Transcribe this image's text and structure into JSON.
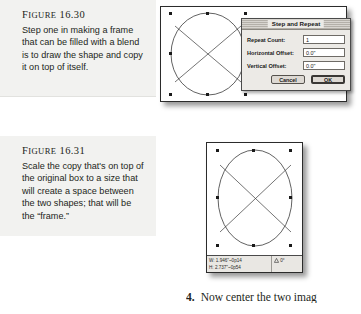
{
  "page": {
    "background_color": "#ffffff",
    "caption_background_color": "#f2f2f0",
    "ink_color": "#231f20"
  },
  "figures": [
    {
      "label_prefix": "F",
      "label_word": "IGURE",
      "label_number": "16.30",
      "caption": "Step one in making a frame that can be filled with a blend is to draw the shape and copy it on top of itself.",
      "artwork": {
        "shape": "ellipse-with-x",
        "selected": true,
        "handle_count": 8
      }
    },
    {
      "label_prefix": "F",
      "label_word": "IGURE",
      "label_number": "16.31",
      "caption": "Scale the copy that's on top of the original box to a size that will create a space between the two shapes; that will be the “frame.”",
      "artwork": {
        "shape": "ellipse-with-x",
        "selected": true,
        "handle_count": 8
      }
    }
  ],
  "dialog": {
    "title": "Step and Repeat",
    "fields": [
      {
        "label": "Repeat Count:",
        "value": "1"
      },
      {
        "label": "Horizontal Offset:",
        "value": "0.0\""
      },
      {
        "label": "Vertical Offset:",
        "value": "0.0\""
      }
    ],
    "buttons": {
      "cancel": "Cancel",
      "ok": "OK"
    }
  },
  "measure_palette": {
    "width_label": "W:",
    "width_value": "1.946\"~0p14",
    "height_label": "H:",
    "height_value": "2.737\"~0p54",
    "angle_icon": "triangle-icon",
    "angle_value": "0°"
  },
  "body_text": {
    "step_number": "4.",
    "step_text": "Now center the two imag"
  }
}
